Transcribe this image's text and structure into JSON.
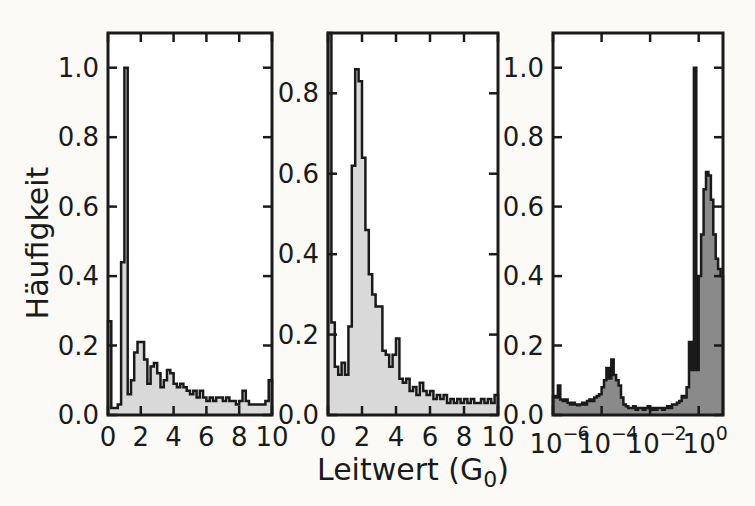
{
  "labels": {
    "ylabel": "Häufigkeit",
    "xlabel_prefix": "Leitwert (G",
    "xlabel_sub": "0",
    "xlabel_suffix": ")"
  },
  "style": {
    "light_fill": "#d9d9d9",
    "dark_fill": "#8a8a8a",
    "line_color": "#1a1a1a",
    "plot_background": "#ffffff",
    "page_background": "#fbfaf7"
  },
  "chart_data": [
    {
      "type": "bar",
      "name": "histogram-linear-1",
      "xscale": "linear",
      "xlim": [
        0,
        10
      ],
      "ylim": [
        0,
        1.1
      ],
      "xticks": [
        0,
        2,
        4,
        6,
        8,
        10
      ],
      "yticks": [
        0.0,
        0.2,
        0.4,
        0.6,
        0.8,
        1.0
      ],
      "bin_start": 0,
      "bin_width": 0.2,
      "fill": "light",
      "values": [
        0.27,
        0.02,
        0.02,
        0.03,
        0.44,
        1.0,
        0.06,
        0.1,
        0.18,
        0.21,
        0.21,
        0.16,
        0.09,
        0.14,
        0.15,
        0.12,
        0.08,
        0.1,
        0.13,
        0.12,
        0.09,
        0.08,
        0.09,
        0.08,
        0.07,
        0.06,
        0.07,
        0.05,
        0.07,
        0.05,
        0.04,
        0.05,
        0.04,
        0.05,
        0.05,
        0.04,
        0.05,
        0.04,
        0.04,
        0.03,
        0.04,
        0.07,
        0.04,
        0.03,
        0.03,
        0.03,
        0.03,
        0.03,
        0.04,
        0.1
      ]
    },
    {
      "type": "bar",
      "name": "histogram-linear-2",
      "xscale": "linear",
      "xlim": [
        0,
        10
      ],
      "ylim": [
        0,
        0.95
      ],
      "xticks": [
        0,
        2,
        4,
        6,
        8,
        10
      ],
      "yticks": [
        0.0,
        0.2,
        0.4,
        0.6,
        0.8
      ],
      "bin_start": 0,
      "bin_width": 0.2,
      "fill": "light",
      "values": [
        0.95,
        0.23,
        0.12,
        0.1,
        0.13,
        0.1,
        0.22,
        0.62,
        0.86,
        0.83,
        0.64,
        0.46,
        0.35,
        0.3,
        0.27,
        0.27,
        0.16,
        0.15,
        0.12,
        0.15,
        0.19,
        0.09,
        0.08,
        0.09,
        0.06,
        0.07,
        0.05,
        0.08,
        0.06,
        0.05,
        0.06,
        0.04,
        0.05,
        0.04,
        0.05,
        0.03,
        0.04,
        0.03,
        0.04,
        0.03,
        0.04,
        0.03,
        0.04,
        0.03,
        0.03,
        0.04,
        0.03,
        0.04,
        0.03,
        0.05
      ]
    },
    {
      "type": "bar",
      "name": "histogram-log",
      "xscale": "log",
      "xtick_base": "10",
      "xlim_exponents": [
        -6,
        1
      ],
      "xtick_exponents": [
        -6,
        -4,
        -2,
        0
      ],
      "ylim": [
        0,
        1.1
      ],
      "yticks": [
        0.0,
        0.2,
        0.4,
        0.6,
        0.8,
        1.0
      ],
      "bin_start_exponent": -6,
      "bin_width_decades": 0.1,
      "fill": "dark",
      "values": [
        0.055,
        0.05,
        0.085,
        0.045,
        0.04,
        0.045,
        0.035,
        0.03,
        0.035,
        0.03,
        0.028,
        0.03,
        0.035,
        0.03,
        0.04,
        0.045,
        0.04,
        0.05,
        0.055,
        0.06,
        0.08,
        0.1,
        0.135,
        0.105,
        0.16,
        0.115,
        0.1,
        0.085,
        0.05,
        0.03,
        0.025,
        0.02,
        0.02,
        0.025,
        0.015,
        0.02,
        0.02,
        0.015,
        0.02,
        0.025,
        0.015,
        0.02,
        0.015,
        0.02,
        0.02,
        0.015,
        0.02,
        0.025,
        0.02,
        0.03,
        0.03,
        0.035,
        0.04,
        0.055,
        0.05,
        0.08,
        0.21,
        0.13,
        1.0,
        0.13,
        0.4,
        0.52,
        0.65,
        0.7,
        0.69,
        0.62,
        0.52,
        0.45,
        0.42,
        0.4
      ]
    }
  ]
}
